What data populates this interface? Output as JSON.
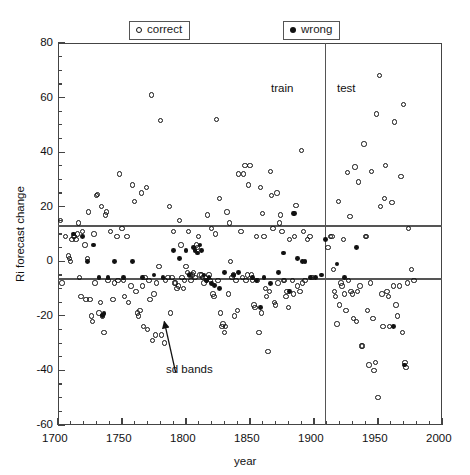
{
  "figure": {
    "y_axis_label": "Ri forecast change",
    "x_axis_label": "year"
  },
  "legend": {
    "correct": {
      "label": "correct",
      "marker": "open-circle"
    },
    "wrong": {
      "label": "wrong",
      "marker": "filled-circle"
    }
  },
  "regions": {
    "train_label": "train",
    "test_label": "test"
  },
  "annotation": {
    "label": "sd bands"
  },
  "chart_data": {
    "type": "scatter",
    "title": "",
    "xlabel": "year",
    "ylabel": "Ri forecast change",
    "xlim": [
      1700,
      2000
    ],
    "ylim": [
      -60,
      80
    ],
    "xticks": [
      1700,
      1750,
      1800,
      1850,
      1900,
      1950,
      2000
    ],
    "yticks": [
      -60,
      -40,
      -20,
      0,
      20,
      40,
      60,
      80
    ],
    "xtick_labels": [
      "1700",
      "1750",
      "1800",
      "1850",
      "1900",
      "1950",
      "2000"
    ],
    "ytick_labels": [
      "-60",
      "-40",
      "-20",
      "0",
      "20",
      "40",
      "60",
      "80"
    ],
    "xminor_step": 10,
    "yminor_step": 5,
    "grid": false,
    "legend_position": "above-axes",
    "annotations": [
      {
        "text": "train",
        "x": 1875,
        "y": 59,
        "type": "region-label"
      },
      {
        "text": "test",
        "x": 1925,
        "y": 59,
        "type": "region-label"
      },
      {
        "text": "sd bands",
        "x": 1806,
        "y": -43,
        "type": "callout",
        "arrow_to_x": 1783,
        "arrow_to_y": -22
      }
    ],
    "reference_lines": [
      {
        "name": "sd-band-upper",
        "orientation": "horizontal",
        "value": 13
      },
      {
        "name": "sd-band-lower",
        "orientation": "horizontal",
        "value": -6.5
      },
      {
        "name": "train-test-split",
        "orientation": "vertical",
        "value": 1909
      }
    ],
    "series": [
      {
        "name": "correct",
        "marker": "open-circle",
        "points": [
          [
            1702,
            15
          ],
          [
            1703,
            -8
          ],
          [
            1706,
            9
          ],
          [
            1708,
            2
          ],
          [
            1709,
            1
          ],
          [
            1710,
            0
          ],
          [
            1711,
            8
          ],
          [
            1712,
            9
          ],
          [
            1713,
            9
          ],
          [
            1714,
            8
          ],
          [
            1715,
            10
          ],
          [
            1716,
            14
          ],
          [
            1717,
            -6
          ],
          [
            1718,
            -13
          ],
          [
            1719,
            11
          ],
          [
            1721,
            6
          ],
          [
            1722,
            -14
          ],
          [
            1723,
            1
          ],
          [
            1724,
            18
          ],
          [
            1725,
            -14
          ],
          [
            1726,
            -20
          ],
          [
            1727,
            -22
          ],
          [
            1728,
            10
          ],
          [
            1729,
            -8
          ],
          [
            1730,
            24
          ],
          [
            1731,
            24.5
          ],
          [
            1732,
            -19
          ],
          [
            1733,
            -15
          ],
          [
            1734,
            20
          ],
          [
            1735,
            -20
          ],
          [
            1736,
            -26
          ],
          [
            1737,
            17
          ],
          [
            1738,
            18
          ],
          [
            1739,
            -7
          ],
          [
            1741,
            11
          ],
          [
            1743,
            -14
          ],
          [
            1744,
            -8
          ],
          [
            1746,
            9
          ],
          [
            1747,
            -7
          ],
          [
            1748,
            32
          ],
          [
            1750,
            12
          ],
          [
            1751,
            -7
          ],
          [
            1752,
            -13
          ],
          [
            1754,
            9
          ],
          [
            1755,
            -15
          ],
          [
            1757,
            -9
          ],
          [
            1758,
            28
          ],
          [
            1760,
            22
          ],
          [
            1761,
            -11
          ],
          [
            1762,
            -19
          ],
          [
            1763,
            -20
          ],
          [
            1764,
            -18
          ],
          [
            1765,
            25
          ],
          [
            1766,
            -9
          ],
          [
            1767,
            -24
          ],
          [
            1768,
            -6
          ],
          [
            1769,
            27
          ],
          [
            1770,
            -25
          ],
          [
            1771,
            -7
          ],
          [
            1772,
            -14
          ],
          [
            1773,
            61
          ],
          [
            1774,
            -29
          ],
          [
            1775,
            -12
          ],
          [
            1776,
            -27
          ],
          [
            1777,
            -8
          ],
          [
            1779,
            -2
          ],
          [
            1780,
            51.5
          ],
          [
            1781,
            -27
          ],
          [
            1783,
            -30
          ],
          [
            1784,
            -7
          ],
          [
            1786,
            -6
          ],
          [
            1787,
            20
          ],
          [
            1788,
            -19
          ],
          [
            1789,
            -6
          ],
          [
            1790,
            11
          ],
          [
            1791,
            -8
          ],
          [
            1792,
            -8
          ],
          [
            1793,
            -10
          ],
          [
            1794,
            -9
          ],
          [
            1795,
            15
          ],
          [
            1796,
            6
          ],
          [
            1797,
            -6
          ],
          [
            1798,
            -10
          ],
          [
            1799,
            -7
          ],
          [
            1800,
            -2
          ],
          [
            1801,
            -4
          ],
          [
            1802,
            11
          ],
          [
            1803,
            -5
          ],
          [
            1804,
            -7
          ],
          [
            1805,
            -5
          ],
          [
            1806,
            -4
          ],
          [
            1807,
            -6
          ],
          [
            1808,
            6
          ],
          [
            1809,
            5
          ],
          [
            1810,
            9
          ],
          [
            1811,
            -5
          ],
          [
            1812,
            -5
          ],
          [
            1813,
            -6
          ],
          [
            1814,
            -8
          ],
          [
            1815,
            -6
          ],
          [
            1816,
            -7
          ],
          [
            1817,
            17
          ],
          [
            1818,
            -5
          ],
          [
            1819,
            -7
          ],
          [
            1820,
            12
          ],
          [
            1821,
            -12
          ],
          [
            1822,
            -13
          ],
          [
            1823,
            10
          ],
          [
            1824,
            52
          ],
          [
            1825,
            -7
          ],
          [
            1826,
            23
          ],
          [
            1827,
            -19
          ],
          [
            1828,
            -24
          ],
          [
            1829,
            -23
          ],
          [
            1830,
            -26
          ],
          [
            1831,
            -24
          ],
          [
            1832,
            18
          ],
          [
            1833,
            -12
          ],
          [
            1834,
            14
          ],
          [
            1835,
            0
          ],
          [
            1836,
            -6
          ],
          [
            1837,
            -5
          ],
          [
            1838,
            -20
          ],
          [
            1839,
            -7
          ],
          [
            1840,
            -18
          ],
          [
            1841,
            32
          ],
          [
            1843,
            11
          ],
          [
            1844,
            -6
          ],
          [
            1845,
            32
          ],
          [
            1846,
            35
          ],
          [
            1847,
            -7
          ],
          [
            1848,
            -5
          ],
          [
            1849,
            28
          ],
          [
            1850,
            35
          ],
          [
            1851,
            -5
          ],
          [
            1852,
            -7
          ],
          [
            1853,
            -16
          ],
          [
            1854,
            -17
          ],
          [
            1855,
            9
          ],
          [
            1856,
            -7
          ],
          [
            1857,
            -26
          ],
          [
            1858,
            27
          ],
          [
            1859,
            -19
          ],
          [
            1860,
            17.5
          ],
          [
            1861,
            9
          ],
          [
            1862,
            -10
          ],
          [
            1863,
            -13
          ],
          [
            1864,
            -33
          ],
          [
            1865,
            -11
          ],
          [
            1866,
            33
          ],
          [
            1867,
            24
          ],
          [
            1868,
            12
          ],
          [
            1869,
            -15
          ],
          [
            1870,
            -16
          ],
          [
            1871,
            25
          ],
          [
            1872,
            -8
          ],
          [
            1873,
            14
          ],
          [
            1874,
            17
          ],
          [
            1875,
            11
          ],
          [
            1876,
            -7
          ],
          [
            1877,
            -7
          ],
          [
            1878,
            -13
          ],
          [
            1879,
            -11
          ],
          [
            1880,
            -17
          ],
          [
            1881,
            8
          ],
          [
            1883,
            -7
          ],
          [
            1884,
            -12
          ],
          [
            1885,
            9
          ],
          [
            1886,
            20.5
          ],
          [
            1887,
            -9
          ],
          [
            1889,
            -11
          ],
          [
            1890,
            40.5
          ],
          [
            1891,
            -8
          ],
          [
            1892,
            11
          ],
          [
            1893,
            -7
          ],
          [
            1895,
            8
          ],
          [
            1897,
            9
          ],
          [
            1899,
            -6
          ],
          [
            1911,
            5
          ],
          [
            1913,
            9
          ],
          [
            1914,
            9
          ],
          [
            1915,
            -3
          ],
          [
            1916,
            -11
          ],
          [
            1917,
            -13
          ],
          [
            1918,
            -23
          ],
          [
            1919,
            22
          ],
          [
            1920,
            -16
          ],
          [
            1921,
            -8
          ],
          [
            1922,
            -9
          ],
          [
            1923,
            8
          ],
          [
            1924,
            -12
          ],
          [
            1925,
            -18
          ],
          [
            1926,
            32.5
          ],
          [
            1927,
            -7
          ],
          [
            1928,
            16.5
          ],
          [
            1929,
            -11
          ],
          [
            1930,
            -12
          ],
          [
            1931,
            -21
          ],
          [
            1932,
            34.5
          ],
          [
            1933,
            -22
          ],
          [
            1934,
            -11
          ],
          [
            1935,
            29
          ],
          [
            1936,
            -9
          ],
          [
            1937,
            -31
          ],
          [
            1938,
            -31
          ],
          [
            1939,
            43
          ],
          [
            1940,
            9
          ],
          [
            1941,
            9
          ],
          [
            1942,
            -18
          ],
          [
            1943,
            -38
          ],
          [
            1944,
            -8
          ],
          [
            1945,
            33
          ],
          [
            1946,
            -21
          ],
          [
            1947,
            -40
          ],
          [
            1948,
            -37
          ],
          [
            1949,
            54
          ],
          [
            1950,
            -50
          ],
          [
            1951,
            68
          ],
          [
            1952,
            20
          ],
          [
            1953,
            -12
          ],
          [
            1954,
            -24
          ],
          [
            1955,
            23
          ],
          [
            1956,
            35
          ],
          [
            1957,
            -11
          ],
          [
            1958,
            -13
          ],
          [
            1959,
            -24
          ],
          [
            1961,
            21.5
          ],
          [
            1962,
            -9
          ],
          [
            1963,
            51
          ],
          [
            1964,
            -16
          ],
          [
            1965,
            -20
          ],
          [
            1967,
            -9
          ],
          [
            1968,
            31
          ],
          [
            1969,
            -26
          ],
          [
            1970,
            57.5
          ],
          [
            1971,
            -37
          ],
          [
            1972,
            -39
          ],
          [
            1973,
            -8
          ],
          [
            1974,
            12
          ],
          [
            1976,
            -3
          ],
          [
            1978,
            -7
          ]
        ]
      },
      {
        "name": "wrong",
        "marker": "filled-circle",
        "points": [
          [
            1712,
            10
          ],
          [
            1719,
            9
          ],
          [
            1723,
            0
          ],
          [
            1728,
            6
          ],
          [
            1732,
            -6
          ],
          [
            1735,
            -20
          ],
          [
            1736,
            -19
          ],
          [
            1739,
            -6
          ],
          [
            1744,
            0
          ],
          [
            1751,
            -6
          ],
          [
            1758,
            0
          ],
          [
            1766,
            -6
          ],
          [
            1775,
            -5
          ],
          [
            1782,
            -6
          ],
          [
            1790,
            4
          ],
          [
            1795,
            1
          ],
          [
            1800,
            4
          ],
          [
            1803,
            -5
          ],
          [
            1806,
            5
          ],
          [
            1807,
            4
          ],
          [
            1809,
            3
          ],
          [
            1811,
            6
          ],
          [
            1812,
            4
          ],
          [
            1814,
            -5
          ],
          [
            1816,
            -7
          ],
          [
            1818,
            -6
          ],
          [
            1820,
            -8
          ],
          [
            1822,
            -9
          ],
          [
            1826,
            -10
          ],
          [
            1830,
            -4
          ],
          [
            1837,
            -5
          ],
          [
            1841,
            -4
          ],
          [
            1852,
            -6
          ],
          [
            1855,
            -7
          ],
          [
            1858,
            -17
          ],
          [
            1861,
            -6
          ],
          [
            1866,
            -8
          ],
          [
            1872,
            -4
          ],
          [
            1876,
            3
          ],
          [
            1881,
            -11
          ],
          [
            1884,
            17.5
          ],
          [
            1885,
            17.5
          ],
          [
            1887,
            1
          ],
          [
            1891,
            0
          ],
          [
            1893,
            0
          ],
          [
            1897,
            -6
          ],
          [
            1901,
            -6
          ],
          [
            1906,
            -5
          ],
          [
            1909,
            8
          ],
          [
            1918,
            -1
          ],
          [
            1924,
            -6
          ],
          [
            1933,
            5
          ],
          [
            1962,
            -24
          ],
          [
            1971,
            -38
          ]
        ]
      }
    ]
  }
}
